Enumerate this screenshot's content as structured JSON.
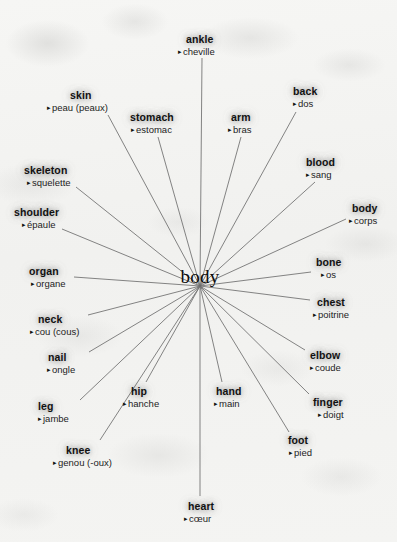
{
  "diagram": {
    "type": "word-web",
    "center": {
      "label": "body",
      "x": 200,
      "y": 277
    },
    "hub": {
      "x": 200,
      "y": 286
    },
    "bullet_glyph": "▸",
    "line_color": "#6e6e6e",
    "page_background": "#f3f3f1",
    "headword_color": "#111111",
    "nodes": [
      {
        "en": "ankle",
        "fr": "cheville",
        "en_x": 186,
        "en_y": 33,
        "fr_x": 178,
        "fr_y": 45,
        "line_x": 202,
        "line_y": 58,
        "align": "left"
      },
      {
        "en": "skin",
        "fr": "peau (peaux)",
        "en_x": 70,
        "en_y": 89,
        "fr_x": 47,
        "fr_y": 101,
        "line_x": 108,
        "line_y": 115,
        "align": "left"
      },
      {
        "en": "stomach",
        "fr": "estomac",
        "en_x": 130,
        "en_y": 111,
        "fr_x": 131,
        "fr_y": 123,
        "line_x": 158,
        "line_y": 137,
        "align": "left"
      },
      {
        "en": "arm",
        "fr": "bras",
        "en_x": 231,
        "en_y": 111,
        "fr_x": 228,
        "fr_y": 123,
        "line_x": 241,
        "line_y": 137,
        "align": "left"
      },
      {
        "en": "back",
        "fr": "dos",
        "en_x": 293,
        "en_y": 85,
        "fr_x": 293,
        "fr_y": 97,
        "line_x": 296,
        "line_y": 112,
        "align": "left"
      },
      {
        "en": "skeleton",
        "fr": "squelette",
        "en_x": 24,
        "en_y": 164,
        "fr_x": 27,
        "fr_y": 176,
        "line_x": 76,
        "line_y": 187,
        "align": "left"
      },
      {
        "en": "blood",
        "fr": "sang",
        "en_x": 306,
        "en_y": 156,
        "fr_x": 306,
        "fr_y": 168,
        "line_x": 315,
        "line_y": 182,
        "align": "left"
      },
      {
        "en": "shoulder",
        "fr": "épaule",
        "en_x": 14,
        "en_y": 206,
        "fr_x": 22,
        "fr_y": 218,
        "line_x": 62,
        "line_y": 229,
        "align": "left"
      },
      {
        "en": "body",
        "fr": "corps",
        "en_x": 352,
        "en_y": 202,
        "fr_x": 349,
        "fr_y": 214,
        "line_x": 346,
        "line_y": 219,
        "align": "left"
      },
      {
        "en": "organ",
        "fr": "organe",
        "en_x": 29,
        "en_y": 265,
        "fr_x": 31,
        "fr_y": 277,
        "line_x": 74,
        "line_y": 277,
        "align": "left"
      },
      {
        "en": "bone",
        "fr": "os",
        "en_x": 316,
        "en_y": 256,
        "fr_x": 321,
        "fr_y": 268,
        "line_x": 311,
        "line_y": 272,
        "align": "left"
      },
      {
        "en": "chest",
        "fr": "poitrine",
        "en_x": 317,
        "en_y": 296,
        "fr_x": 313,
        "fr_y": 308,
        "line_x": 310,
        "line_y": 300,
        "align": "left"
      },
      {
        "en": "neck",
        "fr": "cou (cous)",
        "en_x": 38,
        "en_y": 313,
        "fr_x": 30,
        "fr_y": 325,
        "line_x": 88,
        "line_y": 315,
        "align": "left"
      },
      {
        "en": "elbow",
        "fr": "coude",
        "en_x": 310,
        "en_y": 349,
        "fr_x": 310,
        "fr_y": 361,
        "line_x": 305,
        "line_y": 350,
        "align": "left"
      },
      {
        "en": "nail",
        "fr": "ongle",
        "en_x": 48,
        "en_y": 351,
        "fr_x": 47,
        "fr_y": 363,
        "line_x": 89,
        "line_y": 352,
        "align": "left"
      },
      {
        "en": "hip",
        "fr": "hanche",
        "en_x": 131,
        "en_y": 385,
        "fr_x": 123,
        "fr_y": 397,
        "line_x": 146,
        "line_y": 382,
        "align": "left"
      },
      {
        "en": "hand",
        "fr": "main",
        "en_x": 216,
        "en_y": 385,
        "fr_x": 214,
        "fr_y": 397,
        "line_x": 222,
        "line_y": 382,
        "align": "left"
      },
      {
        "en": "finger",
        "fr": "doigt",
        "en_x": 313,
        "en_y": 396,
        "fr_x": 318,
        "fr_y": 408,
        "line_x": 309,
        "line_y": 394,
        "align": "left"
      },
      {
        "en": "leg",
        "fr": "jambe",
        "en_x": 38,
        "en_y": 400,
        "fr_x": 38,
        "fr_y": 412,
        "line_x": 80,
        "line_y": 400,
        "align": "left"
      },
      {
        "en": "foot",
        "fr": "pied",
        "en_x": 288,
        "en_y": 434,
        "fr_x": 289,
        "fr_y": 446,
        "line_x": 289,
        "line_y": 432,
        "align": "left"
      },
      {
        "en": "knee",
        "fr": "genou (-oux)",
        "en_x": 66,
        "en_y": 444,
        "fr_x": 53,
        "fr_y": 456,
        "line_x": 100,
        "line_y": 440,
        "align": "left"
      },
      {
        "en": "heart",
        "fr": "cœur",
        "en_x": 188,
        "en_y": 500,
        "fr_x": 184,
        "fr_y": 512,
        "line_x": 200,
        "line_y": 496,
        "align": "left"
      }
    ]
  }
}
